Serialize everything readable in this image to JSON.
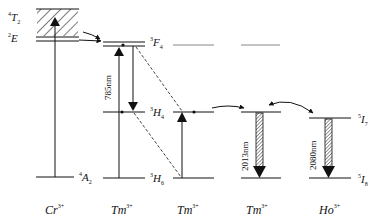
{
  "diagram": {
    "ions": [
      {
        "label": "Cr",
        "charge": "3+"
      },
      {
        "label": "Tm",
        "charge": "3+"
      },
      {
        "label": "Tm",
        "charge": "3+"
      },
      {
        "label": "Tm",
        "charge": "3+"
      },
      {
        "label": "Ho",
        "charge": "3+"
      }
    ],
    "levels": {
      "cr_4T2": {
        "sup": "4",
        "main": "T",
        "sub": "2"
      },
      "cr_2E": {
        "sup": "2",
        "main": "E",
        "sub": ""
      },
      "cr_4A2": {
        "sup": "4",
        "main": "A",
        "sub": "2"
      },
      "tm_3F4": {
        "sup": "3",
        "main": "F",
        "sub": "4"
      },
      "tm_3H4": {
        "sup": "3",
        "main": "H",
        "sub": "4"
      },
      "tm_3H6": {
        "sup": "3",
        "main": "H",
        "sub": "6"
      },
      "ho_5I7": {
        "sup": "5",
        "main": "I",
        "sub": "7"
      },
      "ho_5I8": {
        "sup": "5",
        "main": "I",
        "sub": "8"
      }
    },
    "transitions": {
      "pump": "785nm",
      "tm_emission": "2013nm",
      "ho_emission": "2080nm"
    },
    "colors": {
      "line": "#111111",
      "background": "#ffffff",
      "faint_level": "#777777"
    }
  }
}
